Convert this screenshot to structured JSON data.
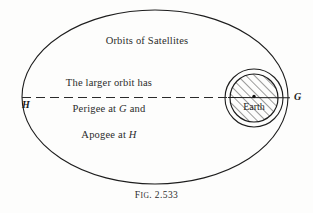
{
  "figure": {
    "caption_prefix": "F",
    "caption_smallcaps": "IG",
    "caption_number": ". 2.533",
    "caption_full": "FIG. 2.533",
    "title_text": "Orbits of Satellites",
    "note_line_1": "The larger orbit has",
    "note_line_2_part_1": "Perigee at ",
    "note_line_2_italic": "G",
    "note_line_2_part_2": " and",
    "note_line_3_part_1": "Apogee at ",
    "note_line_3_italic": "H",
    "earth_label": "Earth",
    "apogee_point_label": "H",
    "perigee_point_label": "G",
    "colors": {
      "stroke": "#1d1d1d",
      "background": "#fdfdfc",
      "text": "#2b2b2b",
      "hatch": "#242424"
    }
  },
  "geometry": {
    "large_ellipse": {
      "cx": 155,
      "cy": 97,
      "rx": 133,
      "ry": 87
    },
    "small_orbit_circle": {
      "cx": 254,
      "cy": 98,
      "r": 29
    },
    "earth_circle": {
      "cx": 254,
      "cy": 98,
      "r": 24
    },
    "earth_center_dot": {
      "cx": 254,
      "cy": 97,
      "r": 1.6
    },
    "major_axis": {
      "x1": 22,
      "y1": 97,
      "x2": 288,
      "y2": 98
    },
    "hatch_angle_degrees": 45,
    "hatch_spacing": 6
  }
}
